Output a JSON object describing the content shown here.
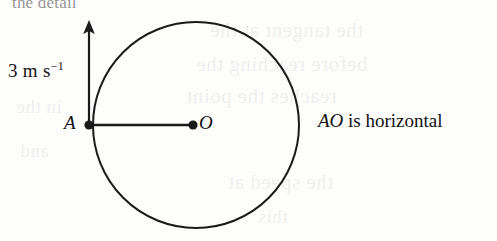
{
  "figure": {
    "kind": "mechanics-circle-diagram",
    "background_color": "#fdfdfc",
    "ink_color": "#1a1a1a",
    "point_A_label": "A",
    "point_O_label": "O",
    "velocity_label_value": "3 m s",
    "velocity_label_exponent": "−1",
    "note_italic_part": "AO",
    "note_rest": " is horizontal",
    "circle": {
      "center_x": 196,
      "center_y": 125,
      "radius": 103,
      "stroke_width": 2
    },
    "segment_AO": {
      "x1": 89,
      "y1": 125,
      "x2": 193,
      "y2": 125,
      "stroke_width": 2.4
    },
    "arrow": {
      "x": 89,
      "y_tail": 127,
      "y_head": 21,
      "stroke_width": 2.2,
      "head_half_width": 6,
      "head_length": 13
    },
    "dot_A": {
      "cx": 89,
      "cy": 125,
      "r": 4.6
    },
    "dot_O": {
      "cx": 193,
      "cy": 125,
      "r": 4.6
    }
  },
  "bleed_through": {
    "top_cut_text": "the detail",
    "ghost_lines": [
      {
        "text": "the tangent at the",
        "left": 210,
        "top": 18,
        "size": 21
      },
      {
        "text": "before reaching the",
        "left": 196,
        "top": 52,
        "size": 21
      },
      {
        "text": "reaches the point",
        "left": 186,
        "top": 84,
        "size": 21
      },
      {
        "text": "the speed at",
        "left": 228,
        "top": 170,
        "size": 21
      },
      {
        "text": "this",
        "left": 258,
        "top": 206,
        "size": 19
      },
      {
        "text": "in the",
        "left": 16,
        "top": 96,
        "size": 19
      },
      {
        "text": "and",
        "left": 20,
        "top": 140,
        "size": 19
      }
    ]
  }
}
